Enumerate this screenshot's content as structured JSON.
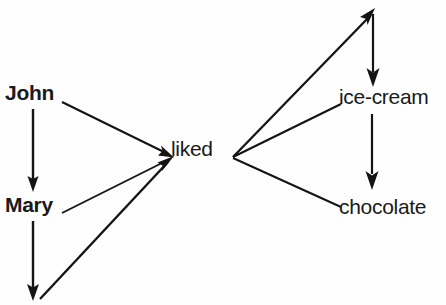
{
  "diagram": {
    "background_color": "#fefefe",
    "stroke_color": "#141414",
    "nodes": [
      {
        "id": "john",
        "label": "John",
        "x": 5,
        "y": 82
      },
      {
        "id": "mary",
        "label": "Mary",
        "x": 5,
        "y": 194
      },
      {
        "id": "liked",
        "label": "liked",
        "x": 171,
        "y": 138
      },
      {
        "id": "ice-cream",
        "label": "ice-cream",
        "x": 339,
        "y": 86
      },
      {
        "id": "chocolate",
        "label": "chocolate",
        "x": 339,
        "y": 196
      }
    ],
    "edges": [
      {
        "id": "john-to-mary",
        "from": "john",
        "to": "mary",
        "kind": "arrow-down"
      },
      {
        "id": "john-to-liked",
        "from": "john",
        "to": "liked",
        "kind": "arrow"
      },
      {
        "id": "mary-to-liked",
        "from": "mary",
        "to": "liked",
        "kind": "plain"
      },
      {
        "id": "mary-down",
        "from": "mary",
        "to": "anchor-bottom",
        "kind": "arrow-down"
      },
      {
        "id": "anchor-bottom-to-liked",
        "from": "anchor-bottom",
        "to": "liked",
        "kind": "arrow"
      },
      {
        "id": "liked-to-anchor-top",
        "from": "liked",
        "to": "anchor-top",
        "kind": "arrow"
      },
      {
        "id": "anchor-top-to-ice-cream",
        "from": "anchor-top",
        "to": "ice-cream",
        "kind": "arrow-down"
      },
      {
        "id": "liked-to-ice-cream",
        "from": "liked",
        "to": "ice-cream",
        "kind": "plain"
      },
      {
        "id": "ice-cream-to-chocolate",
        "from": "ice-cream",
        "to": "chocolate",
        "kind": "arrow-down"
      },
      {
        "id": "liked-to-chocolate",
        "from": "liked",
        "to": "chocolate",
        "kind": "plain"
      }
    ]
  }
}
